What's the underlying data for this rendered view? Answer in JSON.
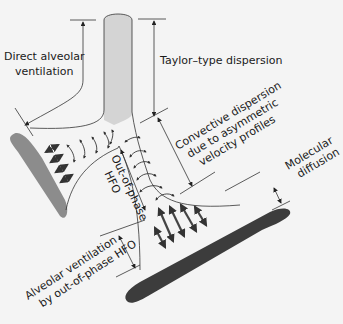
{
  "diagram": {
    "type": "airway bifurcation gas transport mechanisms",
    "labels": {
      "direct_alveolar_1": "Direct alveolar",
      "direct_alveolar_2": "ventilation",
      "taylor": "Taylor–type dispersion",
      "convective_1": "Convective dispersion",
      "convective_2": "due to asymmetric",
      "convective_3": "velocity profiles",
      "molecular_1": "Molecular",
      "molecular_2": "diffusion",
      "out_of_phase_1": "Out-of-phase",
      "out_of_phase_2": "HFO",
      "alveolar_hfo_1": "Alveolar ventilation",
      "alveolar_hfo_2": "by out-of-phase HFO"
    },
    "colors": {
      "background": "#f4f4f4",
      "tube_fill": "#d4d4d4",
      "left_alveolus": "#8c8c8c",
      "right_alveolus": "#3c3c3c",
      "lines": "#333333"
    }
  }
}
